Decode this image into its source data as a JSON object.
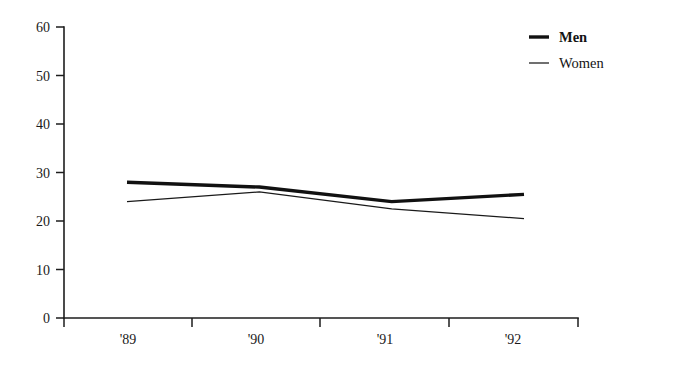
{
  "chart_data": {
    "type": "line",
    "title": "",
    "subtitle": "",
    "xlabel": "",
    "ylabel": "",
    "categories": [
      "'89",
      "'90",
      "'91",
      "'92"
    ],
    "series": [
      {
        "name": "Men",
        "values": [
          28,
          27,
          24,
          25.5
        ],
        "style": "thick",
        "color": "#111111"
      },
      {
        "name": "Women",
        "values": [
          24,
          26,
          22.5,
          20.5
        ],
        "style": "thin",
        "color": "#1a1a1a"
      }
    ],
    "ylim": [
      0,
      60
    ],
    "yticks": [
      0,
      10,
      20,
      30,
      40,
      50,
      60
    ],
    "ytick_labels": [
      "0",
      "10",
      "20",
      "30",
      "40",
      "50",
      "60"
    ],
    "xtick_labels": [
      "'89",
      "'90",
      "'91",
      "'92"
    ],
    "grid": false,
    "legend_position": "top-right",
    "legend": [
      {
        "label": "Men",
        "bold": true
      },
      {
        "label": "Women",
        "bold": false
      }
    ]
  },
  "axes": {
    "y_label_0": "0",
    "y_label_10": "10",
    "y_label_20": "20",
    "y_label_30": "30",
    "y_label_40": "40",
    "y_label_50": "50",
    "y_label_60": "60",
    "x_label_89": "'89",
    "x_label_90": "'90",
    "x_label_91": "'91",
    "x_label_92": "'92"
  }
}
